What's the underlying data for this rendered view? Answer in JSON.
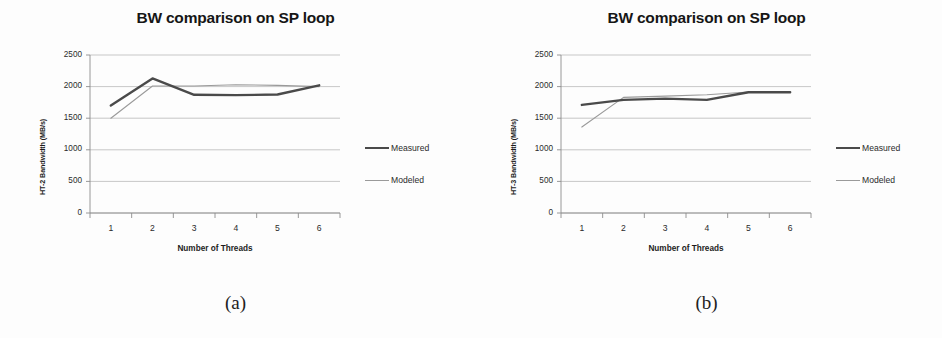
{
  "figure": {
    "panels": [
      {
        "caption": "(a)",
        "title": "BW comparison on SP loop",
        "chart_data": {
          "type": "line",
          "title": "BW comparison on SP loop",
          "xlabel": "Number of Threads",
          "ylabel": "HT-2 Bandwidth (MB/s)",
          "x": [
            1,
            2,
            3,
            4,
            5,
            6
          ],
          "xticklabels": [
            "1",
            "2",
            "3",
            "4",
            "5",
            "6"
          ],
          "yticklabels": [
            "0",
            "500",
            "1000",
            "1500",
            "2000",
            "2500"
          ],
          "yticks": [
            0,
            500,
            1000,
            1500,
            2000,
            2500
          ],
          "ylim": [
            0,
            2500
          ],
          "xlim": [
            0.5,
            6.5
          ],
          "grid": "horizontal",
          "legend_position": "right",
          "series": [
            {
              "name": "Measured",
              "color": "#4a4a4a",
              "width": 2.4,
              "values": [
                1700,
                2130,
                1870,
                1865,
                1875,
                2020
              ]
            },
            {
              "name": "Modeled",
              "color": "#9a9a9a",
              "width": 1.1,
              "values": [
                1500,
                2010,
                2010,
                2030,
                2020,
                2000
              ]
            }
          ]
        }
      },
      {
        "caption": "(b)",
        "title": "BW comparison on SP loop",
        "chart_data": {
          "type": "line",
          "title": "BW comparison on SP loop",
          "xlabel": "Number of Threads",
          "ylabel": "HT-3 Bandwidth (MB/s)",
          "x": [
            1,
            2,
            3,
            4,
            5,
            6
          ],
          "xticklabels": [
            "1",
            "2",
            "3",
            "4",
            "5",
            "6"
          ],
          "yticklabels": [
            "0",
            "500",
            "1000",
            "1500",
            "2000",
            "2500"
          ],
          "yticks": [
            0,
            500,
            1000,
            1500,
            2000,
            2500
          ],
          "ylim": [
            0,
            2500
          ],
          "xlim": [
            0.5,
            6.5
          ],
          "grid": "horizontal",
          "legend_position": "right",
          "series": [
            {
              "name": "Measured",
              "color": "#4a4a4a",
              "width": 2.4,
              "values": [
                1710,
                1790,
                1810,
                1790,
                1910,
                1910
              ]
            },
            {
              "name": "Modeled",
              "color": "#9a9a9a",
              "width": 1.1,
              "values": [
                1360,
                1830,
                1850,
                1870,
                1915,
                1910
              ]
            }
          ]
        }
      }
    ]
  },
  "colors": {
    "measured": "#4a4a4a",
    "modeled": "#9a9a9a",
    "grid": "#b9b9b9",
    "axis": "#8c8c8c",
    "background": "#fdfdfd"
  }
}
